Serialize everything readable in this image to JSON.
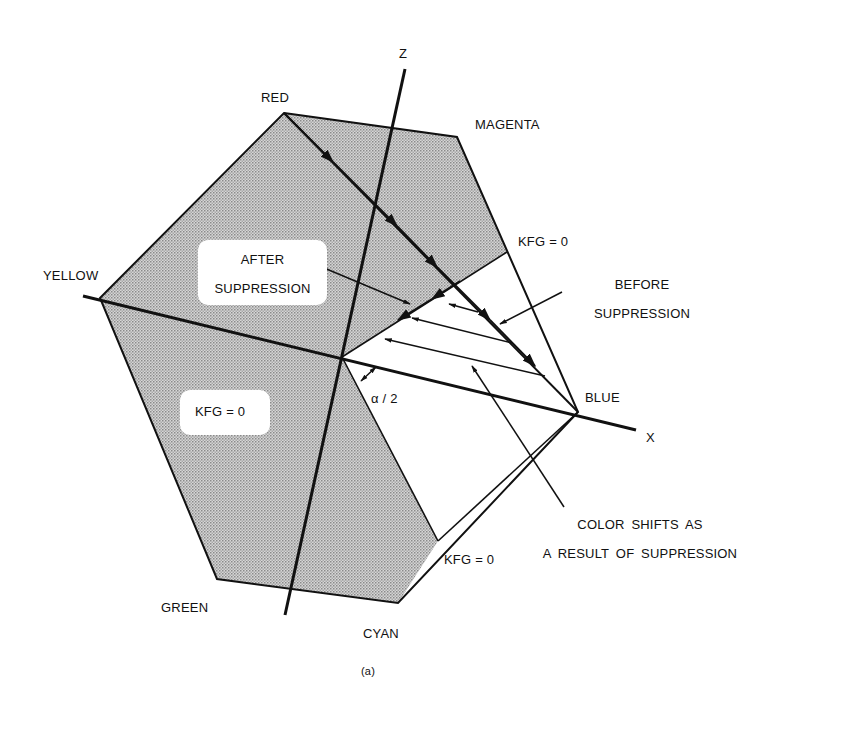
{
  "figure": {
    "caption": "(a)",
    "axes": {
      "z_label": "Z",
      "x_label": "X"
    },
    "vertices": {
      "red": "RED",
      "magenta": "MAGENTA",
      "blue": "BLUE",
      "cyan": "CYAN",
      "green": "GREEN",
      "yellow": "YELLOW"
    },
    "annotations": {
      "kfg_top": "KFG = 0",
      "kfg_bottom": "KFG = 0",
      "kfg_left": "KFG = 0",
      "angle": "α / 2",
      "after_line1": "AFTER",
      "after_line2": "SUPPRESSION",
      "before_line1": "BEFORE",
      "before_line2": "SUPPRESSION",
      "shift_line1": "COLOR SHIFTS AS",
      "shift_line2": "A RESULT OF SUPPRESSION"
    },
    "colors": {
      "shade": "#bdbdbd",
      "ink": "#111111",
      "background": "#ffffff"
    }
  }
}
